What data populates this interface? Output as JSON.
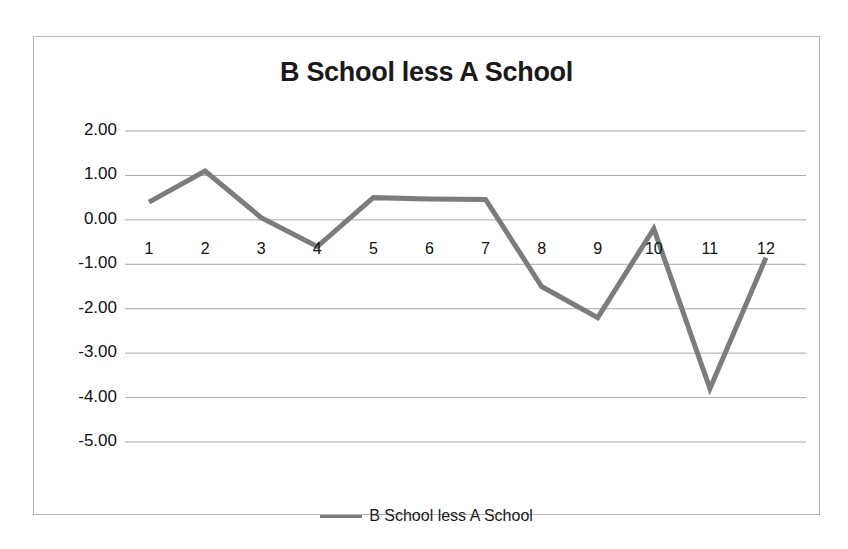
{
  "chart_data": {
    "type": "line",
    "title": "B School less A School",
    "xlabel": "",
    "ylabel": "",
    "categories": [
      "1",
      "2",
      "3",
      "4",
      "5",
      "6",
      "7",
      "8",
      "9",
      "10",
      "11",
      "12"
    ],
    "series": [
      {
        "name": "B School less A School",
        "values": [
          0.4,
          1.1,
          0.05,
          -0.6,
          0.5,
          0.47,
          0.46,
          -1.5,
          -2.2,
          -0.2,
          -3.8,
          -0.85
        ]
      }
    ],
    "ylim": [
      -5.0,
      2.0
    ],
    "yticks": [
      "2.00",
      "1.00",
      "0.00",
      "-1.00",
      "-2.00",
      "-3.00",
      "-4.00",
      "-5.00"
    ],
    "ytick_values": [
      2.0,
      1.0,
      0.0,
      -1.0,
      -2.0,
      -3.0,
      -4.0,
      -5.0
    ],
    "grid": true,
    "legend_position": "bottom",
    "line_color": "#7c7c7c",
    "grid_color": "#a9a9a9",
    "border_color": "#b5b5b5",
    "text_color": "#111111"
  },
  "legend": {
    "label": "B School less A School"
  }
}
